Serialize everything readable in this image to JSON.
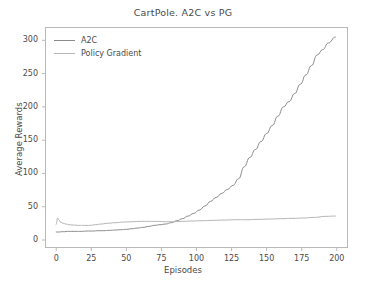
{
  "chart_data": {
    "type": "line",
    "title": "CartPole. A2C vs PG",
    "xlabel": "Episodes",
    "ylabel": "Average Rewards",
    "xlim": [
      -8,
      208
    ],
    "ylim": [
      -12,
      320
    ],
    "xticks": [
      0,
      25,
      50,
      75,
      100,
      125,
      150,
      175,
      200
    ],
    "yticks": [
      0,
      50,
      100,
      150,
      200,
      250,
      300
    ],
    "grid": false,
    "legend_position": "upper left",
    "series": [
      {
        "name": "A2C",
        "color": "#8a8a8a",
        "x": [
          0,
          2,
          4,
          6,
          8,
          10,
          14,
          18,
          22,
          26,
          30,
          34,
          38,
          42,
          46,
          50,
          54,
          58,
          62,
          66,
          70,
          74,
          78,
          82,
          86,
          90,
          94,
          98,
          102,
          106,
          110,
          114,
          118,
          122,
          126,
          130,
          134,
          138,
          142,
          146,
          150,
          154,
          158,
          162,
          166,
          170,
          174,
          178,
          182,
          186,
          190,
          194,
          199
        ],
        "values": [
          12,
          12,
          12.5,
          12.5,
          13,
          13,
          13,
          13,
          13.5,
          13.5,
          14,
          14,
          14.5,
          15,
          15.5,
          16,
          17,
          18,
          19,
          20.5,
          22,
          23,
          24,
          26,
          29,
          32,
          36,
          40,
          45,
          51,
          58,
          64,
          70,
          76,
          82,
          92,
          110,
          124,
          136,
          148,
          160,
          172,
          186,
          200,
          208,
          220,
          234,
          248,
          262,
          278,
          286,
          296,
          305
        ]
      },
      {
        "name": "Policy Gradient",
        "color": "#b5b5b5",
        "x": [
          0,
          1,
          2,
          3,
          5,
          7,
          9,
          12,
          16,
          20,
          24,
          28,
          32,
          36,
          42,
          48,
          54,
          60,
          66,
          72,
          78,
          84,
          90,
          96,
          104,
          112,
          120,
          128,
          136,
          144,
          152,
          160,
          168,
          176,
          184,
          192,
          199
        ],
        "values": [
          23,
          33,
          30,
          27,
          25,
          24,
          23,
          22.5,
          22,
          22,
          22,
          23,
          24,
          25,
          26,
          27,
          27.5,
          28,
          28,
          28,
          27.5,
          27.5,
          28,
          28.5,
          29,
          29.5,
          30,
          30.5,
          30.5,
          31,
          31.5,
          32,
          32.5,
          33,
          34,
          35.5,
          36
        ]
      }
    ]
  },
  "legend": {
    "items": [
      {
        "label": "A2C"
      },
      {
        "label": "Policy Gradient"
      }
    ]
  },
  "axes": {
    "x_tick_labels": [
      "0",
      "25",
      "50",
      "75",
      "100",
      "125",
      "150",
      "175",
      "200"
    ],
    "y_tick_labels": [
      "0",
      "50",
      "100",
      "150",
      "200",
      "250",
      "300"
    ]
  },
  "colors": {
    "a2c_line": "#8a8a8a",
    "pg_line": "#b5b5b5",
    "axis": "#b9b9b9",
    "text": "#4a4a4a",
    "background": "#ffffff"
  }
}
